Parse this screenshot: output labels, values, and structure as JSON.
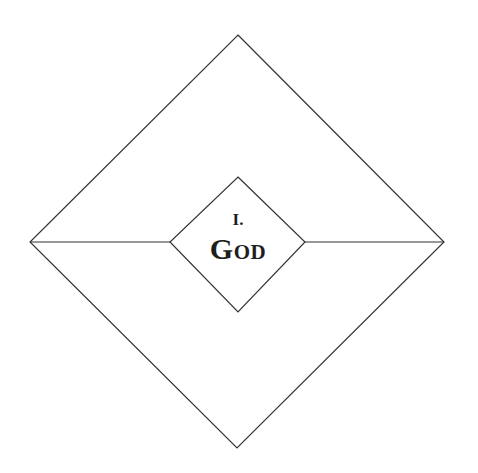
{
  "diagram": {
    "type": "nested-diamonds",
    "outer_diamond": {
      "top": [
        238,
        35
      ],
      "right": [
        444,
        242
      ],
      "bottom": [
        237,
        448
      ],
      "left": [
        30,
        242
      ]
    },
    "inner_diamond": {
      "top": [
        238,
        177
      ],
      "right": [
        305,
        242
      ],
      "bottom": [
        238,
        312
      ],
      "left": [
        170,
        242
      ]
    },
    "connector_lines": [
      {
        "from": [
          30,
          242
        ],
        "to": [
          170,
          242
        ]
      },
      {
        "from": [
          305,
          242
        ],
        "to": [
          444,
          242
        ]
      }
    ],
    "stroke_color": "#333333",
    "text_color": "#1e1e1e"
  },
  "label": {
    "numeral": "I.",
    "title": "God"
  }
}
